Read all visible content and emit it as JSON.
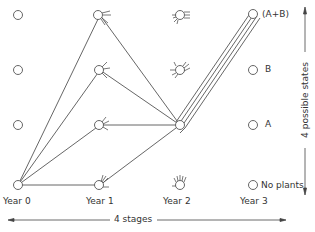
{
  "diagram": {
    "stages": [
      {
        "label": "Year 0",
        "x": 18
      },
      {
        "label": "Year 1",
        "x": 100
      },
      {
        "label": "Year 2",
        "x": 180
      },
      {
        "label": "Year 3",
        "x": 255
      }
    ],
    "states": [
      {
        "label": "(A+B)",
        "y": 15
      },
      {
        "label": "B",
        "y": 70
      },
      {
        "label": "A",
        "y": 125
      },
      {
        "label": "No plants",
        "y": 185
      }
    ],
    "horizontal_axis_label": "4 stages",
    "vertical_axis_label": "4 possible states",
    "colors": {
      "line": "#555555",
      "node": "#555555",
      "text": "#333333"
    }
  }
}
